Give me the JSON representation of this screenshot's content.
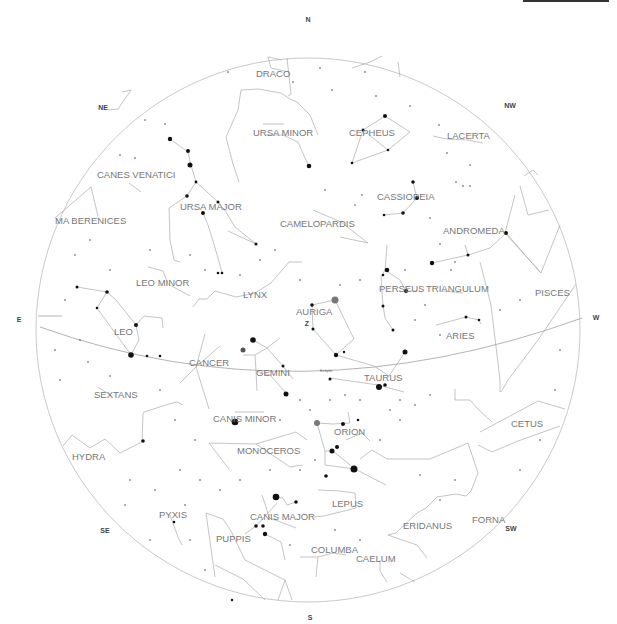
{
  "top_indicator": {
    "color": "#333333"
  },
  "directions": [
    {
      "label": "N",
      "x": 308,
      "y": 22
    },
    {
      "label": "NE",
      "x": 103,
      "y": 110
    },
    {
      "label": "NW",
      "x": 510,
      "y": 108
    },
    {
      "label": "E",
      "x": 19,
      "y": 322
    },
    {
      "label": "W",
      "x": 596,
      "y": 318
    },
    {
      "label": "SE",
      "x": 105,
      "y": 533
    },
    {
      "label": "SW",
      "x": 511,
      "y": 530
    },
    {
      "label": "S",
      "x": 310,
      "y": 619
    }
  ],
  "ecliptic": {
    "label": "Ecliptic"
  },
  "constellations": [
    {
      "name": "DRACO",
      "x": 256,
      "y": 77
    },
    {
      "name": "URSA MINOR",
      "x": 253,
      "y": 135
    },
    {
      "name": "CEPHEUS",
      "x": 349,
      "y": 135
    },
    {
      "name": "LACERTA",
      "x": 447,
      "y": 139
    },
    {
      "name": "CANES VENATICI",
      "x": 97,
      "y": 178
    },
    {
      "name": "CASSIOPEIA",
      "x": 377,
      "y": 200
    },
    {
      "name": "URSA MAJOR",
      "x": 180,
      "y": 210
    },
    {
      "name": "MA BERENICES",
      "x": 55,
      "y": 223
    },
    {
      "name": "CAMELOPARDIS",
      "x": 280,
      "y": 226
    },
    {
      "name": "ANDROMEDA",
      "x": 443,
      "y": 233
    },
    {
      "name": "LEO MINOR",
      "x": 136,
      "y": 286
    },
    {
      "name": "PERSEUS",
      "x": 379,
      "y": 291
    },
    {
      "name": "TRIANGULUM",
      "x": 426,
      "y": 291
    },
    {
      "name": "PISCES",
      "x": 535,
      "y": 295
    },
    {
      "name": "LYNX",
      "x": 243,
      "y": 297
    },
    {
      "name": "AURIGA",
      "x": 296,
      "y": 314
    },
    {
      "name": "LEO",
      "x": 114,
      "y": 334
    },
    {
      "name": "ARIES",
      "x": 446,
      "y": 338
    },
    {
      "name": "CANCER",
      "x": 189,
      "y": 365
    },
    {
      "name": "GEMINI",
      "x": 256,
      "y": 375
    },
    {
      "name": "TAURUS",
      "x": 364,
      "y": 380
    },
    {
      "name": "SEXTANS",
      "x": 94,
      "y": 397
    },
    {
      "name": "CANIS MINOR",
      "x": 213,
      "y": 421
    },
    {
      "name": "CETUS",
      "x": 511,
      "y": 426
    },
    {
      "name": "ORION",
      "x": 334,
      "y": 434
    },
    {
      "name": "MONOCEROS",
      "x": 237,
      "y": 453
    },
    {
      "name": "HYDRA",
      "x": 72,
      "y": 459
    },
    {
      "name": "LEPUS",
      "x": 332,
      "y": 506
    },
    {
      "name": "PYXIS",
      "x": 159,
      "y": 517
    },
    {
      "name": "CANIS MAJOR",
      "x": 250,
      "y": 519
    },
    {
      "name": "FORNA",
      "x": 472,
      "y": 522
    },
    {
      "name": "ERIDANUS",
      "x": 403,
      "y": 528
    },
    {
      "name": "PUPPIS",
      "x": 216,
      "y": 541
    },
    {
      "name": "COLUMBA",
      "x": 311,
      "y": 552
    },
    {
      "name": "CAELUM",
      "x": 356,
      "y": 561
    }
  ],
  "markers": [
    {
      "label": "Z",
      "x": 307,
      "y": 325
    }
  ]
}
